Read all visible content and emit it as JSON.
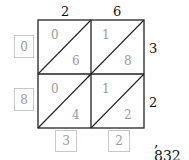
{
  "diagram": {
    "type": "lattice-multiplication",
    "multiplicand": "26",
    "multiplier": "32",
    "top_digits": [
      "2",
      "6"
    ],
    "right_digits": [
      "3",
      "2"
    ],
    "cells": [
      [
        {
          "tens": "0",
          "ones": "6"
        },
        {
          "tens": "1",
          "ones": "8"
        }
      ],
      [
        {
          "tens": "0",
          "ones": "4"
        },
        {
          "tens": "1",
          "ones": "2"
        }
      ]
    ],
    "left_sums": [
      "0",
      "8"
    ],
    "bottom_sums": [
      "3",
      "2"
    ],
    "result": ", 832",
    "colors": {
      "grid": "#222222",
      "cell_digits": "#9a9a9a",
      "box_border": "#c8c8c8"
    }
  }
}
